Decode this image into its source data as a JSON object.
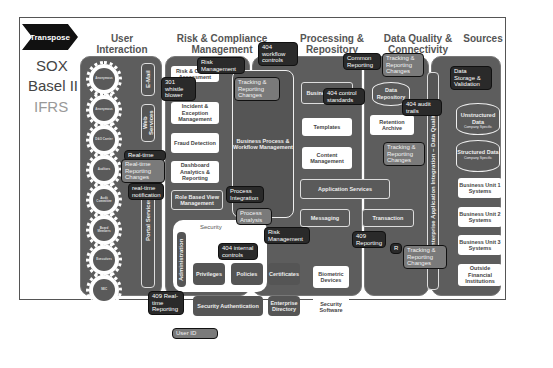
{
  "brand": {
    "logo_label": "Transpose"
  },
  "regulations": [
    "SOX",
    "Basel II",
    "IFRS"
  ],
  "columns": [
    {
      "title": "User Interaction"
    },
    {
      "title": "Risk & Compliance Management"
    },
    {
      "title": "Processing & Repository"
    },
    {
      "title": "Data Quality & Connectivity"
    },
    {
      "title": "Sources"
    }
  ],
  "user_interaction": {
    "actors": [
      "Anonymous",
      "Anonymous",
      "D&O Carrier",
      "Auditors",
      "Audit Committee",
      "Board Members",
      "Executives",
      "SEC"
    ],
    "channels": [
      "E-Mail",
      "Web Services",
      "Portal Services"
    ]
  },
  "risk_compliance": {
    "boxes": [
      "Risk & Control Assessment",
      "Incident & Exception Management",
      "Fraud Detection",
      "Dashboard Analytics & Reporting",
      "Role Based View Management"
    ],
    "workflow": "Business Process & Workflow Management",
    "security": {
      "title": "Security",
      "administration": "Administration",
      "items": [
        "Privileges",
        "Policies",
        "Certificates",
        "Security Authentication",
        "Enterprise Directory"
      ]
    }
  },
  "processing": {
    "boxes": [
      "Business Rules",
      "Templates",
      "Content Management",
      "Application Services",
      "Messaging",
      "Transaction",
      "Biometric Devices",
      "Security Software"
    ]
  },
  "data_quality": {
    "boxes": [
      "Data Repository",
      "Retention Archive"
    ],
    "eai_bar": "Enterprise Application Integration – Data Quality"
  },
  "sources": {
    "databases": [
      {
        "title": "Unstructured Data",
        "sub": "Company Specific"
      },
      {
        "title": "Structured Data",
        "sub": "Company Specific"
      }
    ],
    "systems": [
      "Business Unit 1 Systems",
      "Business Unit 2 Systems",
      "Business Unit 3 Systems",
      "Outside Financial Institutions"
    ]
  },
  "callouts": {
    "risk_mgmt_top": "Risk Management",
    "workflow_controls": "404 workflow controls",
    "whistle_blower": "301 whistle blower",
    "tracking_1": "Tracking & Reporting Changes",
    "control_standards": "404 control standards",
    "common_reporting": "Common Reporting",
    "tracking_2": "Tracking & Reporting Changes",
    "data_storage": "Data Storage & Validation",
    "audit_trails": "404 audit trails",
    "tracking_3": "Tracking & Reporting Changes",
    "realtime": "Real-time",
    "realtime_changes": "Real-time Reporting Changes",
    "realtime_notif": "real-time notification",
    "process_integration": "Process Integration",
    "process_analysis": "Process Analysis",
    "risk_mgmt_bottom": "Risk Management",
    "internal_controls": "404 internal controls",
    "reporting_409": "409 Reporting",
    "realtime_409": "409 Real-time Reporting",
    "tracking_4": "Tracking & Reporting Changes",
    "r_partial": "R",
    "user_id": "User ID"
  }
}
